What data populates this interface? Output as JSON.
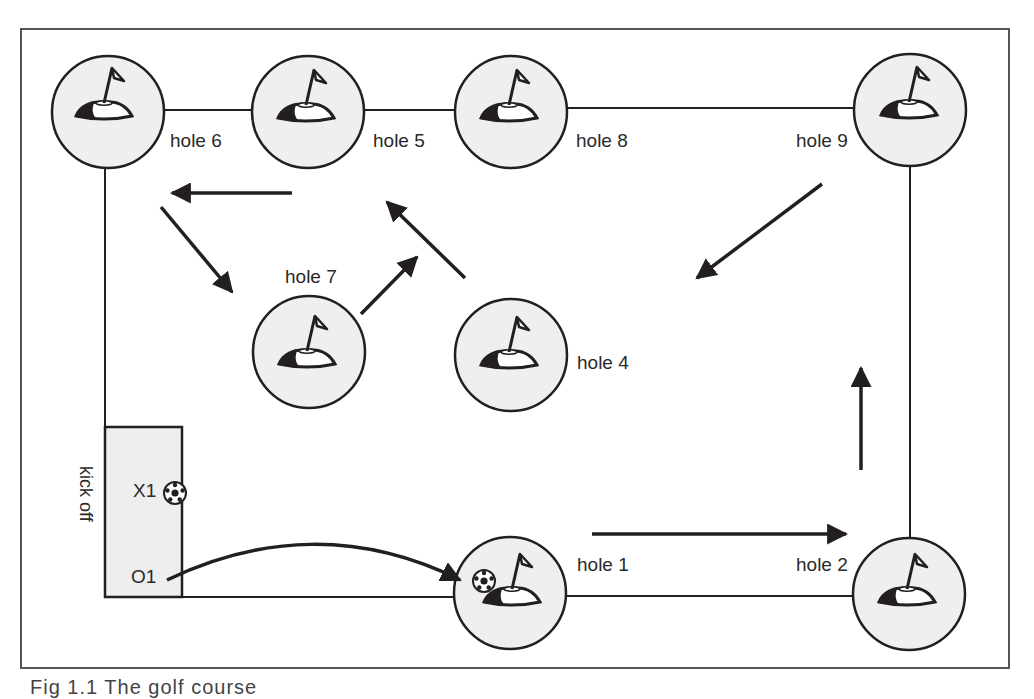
{
  "figure": {
    "caption": "Fig 1.1  The golf course",
    "kickoff_label": "kick off",
    "players": [
      {
        "label": "X1",
        "has_ball": true
      },
      {
        "label": "O1",
        "has_ball": false
      }
    ],
    "holes": [
      {
        "id": "hole-6",
        "label": "hole 6",
        "cx": 108,
        "cy": 112
      },
      {
        "id": "hole-5",
        "label": "hole 5",
        "cx": 308,
        "cy": 112
      },
      {
        "id": "hole-8",
        "label": "hole 8",
        "cx": 511,
        "cy": 112
      },
      {
        "id": "hole-9",
        "label": "hole 9",
        "cx": 910,
        "cy": 110
      },
      {
        "id": "hole-7",
        "label": "hole 7",
        "cx": 309,
        "cy": 352
      },
      {
        "id": "hole-4",
        "label": "hole 4",
        "cx": 511,
        "cy": 355
      },
      {
        "id": "hole-1",
        "label": "hole 1",
        "cx": 510,
        "cy": 593,
        "has_ball": true
      },
      {
        "id": "hole-2",
        "label": "hole 2",
        "cx": 909,
        "cy": 594
      }
    ],
    "route_order": [
      "kick off",
      "hole 1",
      "hole 2",
      "hole 9",
      "hole 4",
      "hole 5",
      "hole 6",
      "hole 7",
      "hole 8"
    ],
    "colors": {
      "ink": "#231f20",
      "hole_fill": "#efefef",
      "box_fill": "#eeeeee",
      "frame": "#555555"
    }
  }
}
